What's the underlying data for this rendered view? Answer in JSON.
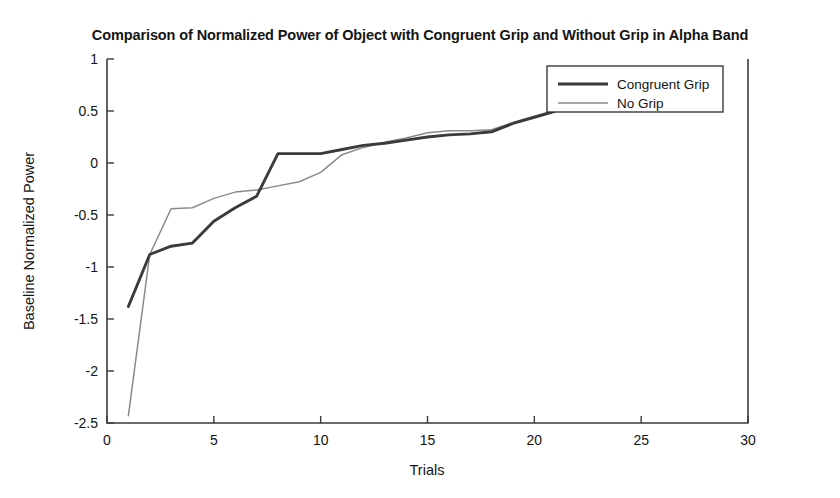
{
  "chart_data": {
    "type": "line",
    "title": "Comparison of Normalized Power of Object with Congruent Grip and Without Grip in Alpha Band",
    "xlabel": "Trials",
    "ylabel": "Baseline Normalized Power",
    "xlim": [
      0,
      30
    ],
    "ylim": [
      -2.5,
      1
    ],
    "xticks": [
      0,
      5,
      10,
      15,
      20,
      25,
      30
    ],
    "xtick_labels": [
      "0",
      "5",
      "10",
      "15",
      "20",
      "25",
      "30"
    ],
    "yticks": [
      1,
      0.5,
      0,
      -0.5,
      -1,
      -1.5,
      -2,
      -2.5
    ],
    "ytick_labels": [
      "1",
      "0.5",
      "0",
      "-0.5",
      "-1",
      "-1.5",
      "-2",
      "-2.5"
    ],
    "grid": false,
    "legend_position": "top-right",
    "x": [
      1,
      2,
      3,
      4,
      5,
      6,
      7,
      8,
      9,
      10,
      11,
      12,
      13,
      14,
      15,
      16,
      17,
      18,
      19,
      20,
      21
    ],
    "series": [
      {
        "name": "Congruent Grip",
        "color": "#3b3b3b",
        "linewidth": "thick",
        "values": [
          -1.38,
          -0.88,
          -0.8,
          -0.77,
          -0.56,
          -0.43,
          -0.32,
          0.09,
          0.09,
          0.09,
          0.13,
          0.17,
          0.19,
          0.22,
          0.25,
          0.27,
          0.28,
          0.3,
          0.38,
          0.44,
          0.5
        ]
      },
      {
        "name": "No Grip",
        "color": "#8a8a8a",
        "linewidth": "thin",
        "values": [
          -2.43,
          -0.88,
          -0.44,
          -0.43,
          -0.34,
          -0.28,
          -0.26,
          -0.22,
          -0.18,
          -0.09,
          0.08,
          0.15,
          0.2,
          0.24,
          0.29,
          0.31,
          0.31,
          0.32,
          0.39,
          0.45,
          0.5
        ]
      }
    ]
  },
  "legend": {
    "items": [
      {
        "label": "Congruent Grip"
      },
      {
        "label": "No Grip"
      }
    ]
  }
}
